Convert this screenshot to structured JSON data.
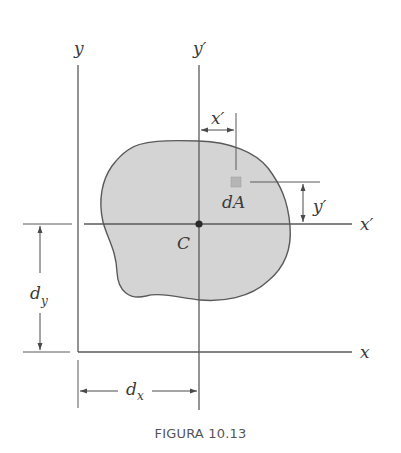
{
  "figure": {
    "caption": "FIGURA 10.13",
    "labels": {
      "y_axis": "y",
      "y_prime_axis": "y′",
      "x_axis": "x",
      "x_prime_axis": "x′",
      "centroid": "C",
      "area_element": "dA",
      "x_prime_dim": "x′",
      "y_prime_dim": "y′",
      "dy_main": "d",
      "dy_sub": "y",
      "dx_main": "d",
      "dx_sub": "x"
    },
    "colors": {
      "line": "#5a5a5a",
      "shape_fill": "#d4d4d4",
      "shape_stroke": "#5a5a5a",
      "centroid": "#2a2a2a",
      "element_fill": "#b5b5b5"
    }
  }
}
